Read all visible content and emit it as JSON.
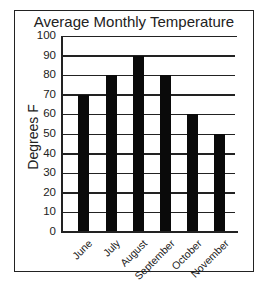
{
  "chart_data": {
    "type": "bar",
    "title": "Average Monthly Temperature",
    "xlabel": "",
    "ylabel": "Degrees F",
    "categories": [
      "June",
      "July",
      "August",
      "September",
      "October",
      "November"
    ],
    "values": [
      70,
      80,
      90,
      80,
      60,
      50
    ],
    "ylim": [
      0,
      100
    ],
    "yticks": [
      0,
      10,
      20,
      30,
      40,
      50,
      60,
      70,
      80,
      90,
      100
    ],
    "grid": true,
    "legend": null,
    "bar_color": "#0a0a0a"
  },
  "labels": {
    "title": "Average Monthly Temperature",
    "ylabel": "Degrees F",
    "yticks": [
      "0",
      "10",
      "20",
      "30",
      "40",
      "50",
      "60",
      "70",
      "80",
      "90",
      "100"
    ],
    "categories": [
      "June",
      "July",
      "August",
      "September",
      "October",
      "November"
    ]
  }
}
